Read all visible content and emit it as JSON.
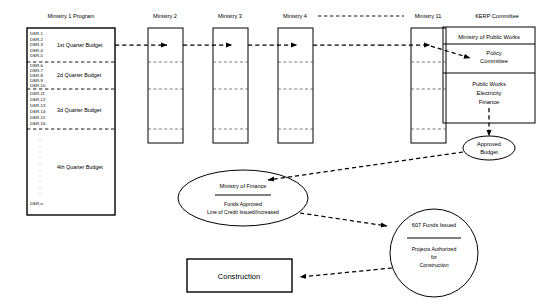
{
  "diagram": {
    "columns": [
      {
        "id": "ministry1",
        "header": "Ministry 1 Program"
      },
      {
        "id": "ministry2",
        "header": "Ministry 2"
      },
      {
        "id": "ministry3",
        "header": "Ministry 3"
      },
      {
        "id": "ministry4",
        "header": "Ministry 4"
      },
      {
        "id": "ministry11",
        "header": "Ministry 11"
      }
    ],
    "quarters": [
      {
        "label": "1st Quarter Budget",
        "items": [
          "DSR-1",
          "DSR-2",
          "DSR-3",
          "DSR-4",
          "DSR-5"
        ]
      },
      {
        "label": "2d Quarter Budget",
        "items": [
          "DSR-6",
          "DSR-7",
          "DSR-8",
          "DSR-9",
          "DSR-10"
        ]
      },
      {
        "label": "3d Quarter Budget",
        "items": [
          "DSR-11",
          "DSR-12",
          "DSR-13",
          "DSR-14",
          "DSR-15",
          "DSR-16"
        ]
      },
      {
        "label": "4th Quarter Budget",
        "items": [
          "DSR-n"
        ]
      }
    ],
    "kerp": {
      "header": "KERP Committee",
      "top_row": "Ministry of Public Works",
      "policy": "Policy Committee",
      "members": [
        "Public Works",
        "Electricity",
        "Finance"
      ]
    },
    "approved_budget": {
      "label": "Approved Budget"
    },
    "finance": {
      "title": "Ministry of Finance",
      "line1": "Funds Approved",
      "line2": "Line of Credit Issued/Increased"
    },
    "funds": {
      "title": "607 Funds Issued",
      "line1": "Projects Authorized",
      "line2": "for",
      "line3": "Construction"
    },
    "construction": {
      "label": "Construction"
    },
    "ellipsis": "⋮",
    "colors": {
      "stroke": "#000000",
      "background": "#ffffff",
      "divider": "#444444"
    }
  }
}
